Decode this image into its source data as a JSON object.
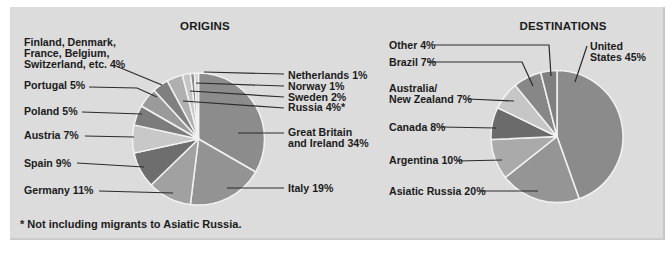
{
  "figure": {
    "background_color": "#dcdcdc",
    "page_color": "#ffffff",
    "text_color": "#1b1b1b",
    "footnote": "* Not including migrants to Asiatic Russia."
  },
  "chart_data": [
    {
      "type": "pie",
      "title": "ORIGINS",
      "unit": "percent",
      "direction": "clockwise",
      "start_angle_deg": 0,
      "legend_position": "callout-labels",
      "categories": [
        "Great Britain and Ireland",
        "Italy",
        "Germany",
        "Spain",
        "Austria",
        "Poland",
        "Portugal",
        "Finland, Denmark, France, Belgium, Switzerland, etc.",
        "Russia",
        "Sweden",
        "Norway",
        "Netherlands"
      ],
      "values": [
        34,
        19,
        11,
        9,
        7,
        5,
        5,
        4,
        4,
        2,
        1,
        1
      ],
      "colors": [
        "#8c8c8c",
        "#939393",
        "#a1a1a1",
        "#6e6e6e",
        "#c8c8c8",
        "#7c7c7c",
        "#9a9a9a",
        "#808080",
        "#b0b0b0",
        "#c5c5c5",
        "#8a8a8a",
        "#d4d4d4"
      ],
      "label_lines": [
        [
          "Great Britain",
          "and Ireland  34%"
        ],
        [
          "Italy 19%"
        ],
        [
          "Germany 11%"
        ],
        [
          "Spain 9%"
        ],
        [
          "Austria 7%"
        ],
        [
          "Poland 5%"
        ],
        [
          "Portugal 5%"
        ],
        [
          "Finland, Denmark,",
          "France, Belgium,",
          "Switzerland, etc.  4%"
        ],
        [
          "Russia 4%*"
        ],
        [
          "Sweden 2%"
        ],
        [
          "Norway 1%"
        ],
        [
          "Netherlands 1%"
        ]
      ]
    },
    {
      "type": "pie",
      "title": "DESTINATIONS",
      "unit": "percent",
      "direction": "clockwise",
      "start_angle_deg": 0,
      "legend_position": "callout-labels",
      "categories": [
        "United States",
        "Asiatic Russia",
        "Argentina",
        "Canada",
        "Australia/New Zealand",
        "Brazil",
        "Other"
      ],
      "values": [
        45,
        20,
        10,
        8,
        7,
        7,
        4
      ],
      "colors": [
        "#8b8b8b",
        "#959595",
        "#aaaaaa",
        "#6b6b6b",
        "#c6c6c6",
        "#878787",
        "#7f7f7f"
      ],
      "label_lines": [
        [
          "United",
          "States 45%"
        ],
        [
          "Asiatic Russia 20%"
        ],
        [
          "Argentina 10%"
        ],
        [
          "Canada 8%"
        ],
        [
          "Australia/",
          "New Zealand 7%"
        ],
        [
          "Brazil 7%"
        ],
        [
          "Other 4%"
        ]
      ]
    }
  ]
}
